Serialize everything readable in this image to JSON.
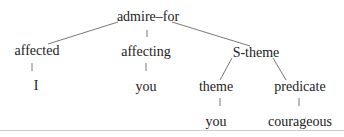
{
  "tree": {
    "root": "admire–for",
    "nodes": {
      "affected": "affected",
      "affecting": "affecting",
      "s_theme": "S-theme",
      "i": "I",
      "you1": "you",
      "theme": "theme",
      "predicate": "predicate",
      "you2": "you",
      "courageous": "courageous"
    }
  }
}
